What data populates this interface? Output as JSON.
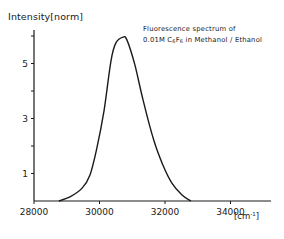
{
  "chart_data": {
    "type": "line",
    "title": "Fluorescence spectrum of 0.01M C6F6 in Methanol / Ethanol",
    "title_lines": [
      "Fluorescence spectrum of",
      "0.01M C",
      "6",
      "F",
      "6",
      " in Methanol / Ethanol"
    ],
    "xlabel": "[cm-1]",
    "ylabel": "Intensity [norm]",
    "xlim": [
      28000,
      35200
    ],
    "ylim": [
      0,
      6.3
    ],
    "x_ticks": [
      28000,
      30000,
      32000,
      34000
    ],
    "x_tick_labels": [
      "28000",
      "30000",
      "32000",
      "34000"
    ],
    "y_ticks": [
      1,
      2,
      3,
      4,
      5,
      6
    ],
    "y_tick_labels": [
      "1",
      "",
      "3",
      "",
      "5",
      ""
    ],
    "grid": false,
    "legend": null,
    "series": [
      {
        "name": "Fluorescence C6F6 in Methanol/Ethanol",
        "x": [
          28760,
          29100,
          29470,
          29710,
          29920,
          30140,
          30350,
          30500,
          30720,
          30840,
          31080,
          31330,
          31660,
          31940,
          32210,
          32520,
          32790
        ],
        "y": [
          0.0,
          0.15,
          0.47,
          0.95,
          1.93,
          3.3,
          5.1,
          5.75,
          5.96,
          5.85,
          4.95,
          3.67,
          2.2,
          1.3,
          0.65,
          0.22,
          0.0
        ]
      }
    ],
    "peak": {
      "x": 30720,
      "y": 5.96
    }
  },
  "labels": {
    "ylabel": "Intensity[norm]",
    "title_line1": "Fluorescence spectrum of",
    "title_line2_prefix": "0.01M C",
    "title_sub1": "6",
    "title_mid": "F",
    "title_sub2": "6",
    "title_line2_suffix": " in Methanol / Ethanol",
    "unit_prefix": "[cm",
    "unit_sup": "-1",
    "unit_suffix": "]"
  },
  "style": {
    "line_color": "#1a1a1a",
    "axis_color": "#1a1a1a",
    "background": "#ffffff"
  }
}
